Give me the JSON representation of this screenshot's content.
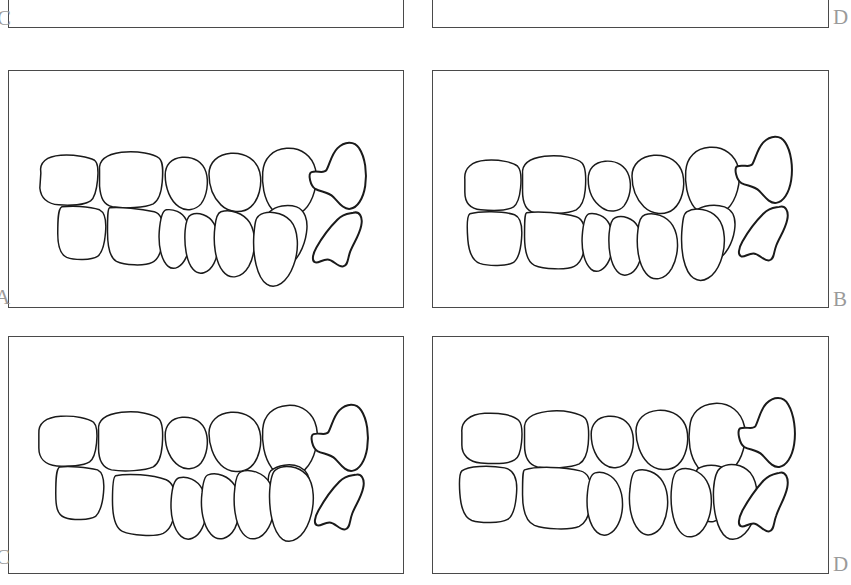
{
  "figure": {
    "kind": "line-drawing-figure",
    "width_px": 851,
    "height_px": 585,
    "background_color": "#ffffff",
    "stroke_color": "#1a1a1a",
    "panel_border_color": "#4a4a4a",
    "label_color": "#9a9a9a",
    "panel_rows": 3,
    "panel_columns": 2
  },
  "panels": [
    {
      "id": "panel-c-top",
      "label": "C",
      "label_position": "outside-left-bottom",
      "row": "top-cropped",
      "column": "left",
      "content": "empty-cropped",
      "cropped": true,
      "rect": {
        "x": 8,
        "y": -40,
        "w": 396,
        "h": 68
      }
    },
    {
      "id": "panel-d-top",
      "label": "D",
      "label_position": "outside-right-bottom",
      "row": "top-cropped",
      "column": "right",
      "content": "empty-cropped",
      "cropped": true,
      "rect": {
        "x": 432,
        "y": -40,
        "w": 397,
        "h": 68
      }
    },
    {
      "id": "panel-a",
      "label": "A",
      "label_position": "outside-left-bottom",
      "row": "middle",
      "column": "left",
      "content": "occlusion-drawing",
      "cropped": false,
      "rect": {
        "x": 8,
        "y": 70,
        "w": 396,
        "h": 238
      },
      "description": "Open-bite / stepped occlusion: upper row offset forward from lower row with large vertical step between first and second tooth",
      "upper_teeth_count": 6,
      "lower_teeth_count": 6,
      "molar_outlines_count": 2
    },
    {
      "id": "panel-b",
      "label": "B",
      "label_position": "outside-right-bottom",
      "row": "middle",
      "column": "right",
      "content": "occlusion-drawing",
      "cropped": false,
      "rect": {
        "x": 432,
        "y": 70,
        "w": 397,
        "h": 238
      },
      "description": "Tighter occlusion: upper and lower rows nearly aligned with slight cusp interdigitation",
      "upper_teeth_count": 6,
      "lower_teeth_count": 6,
      "molar_outlines_count": 2
    },
    {
      "id": "panel-c",
      "label": "C",
      "label_position": "outside-left-bottom",
      "row": "bottom",
      "column": "left",
      "content": "occlusion-drawing",
      "cropped": false,
      "rect": {
        "x": 8,
        "y": 336,
        "w": 396,
        "h": 238
      },
      "description": "Stepped occlusion with pronounced anterior step and posterior cusp interlock",
      "upper_teeth_count": 6,
      "lower_teeth_count": 6,
      "molar_outlines_count": 2
    },
    {
      "id": "panel-d",
      "label": "D",
      "label_position": "outside-right-bottom",
      "row": "bottom",
      "column": "right",
      "content": "occlusion-drawing",
      "cropped": true,
      "rect": {
        "x": 432,
        "y": 336,
        "w": 397,
        "h": 238
      },
      "description": "Fully interdigitated occlusion: upper and lower rows meet flush with cusp-to-cusp contact",
      "upper_teeth_count": 6,
      "lower_teeth_count": 6,
      "molar_outlines_count": 2
    }
  ],
  "labels": {
    "a": "A",
    "b": "B",
    "c": "C",
    "d": "D",
    "c_top": "C",
    "d_top": "D"
  }
}
